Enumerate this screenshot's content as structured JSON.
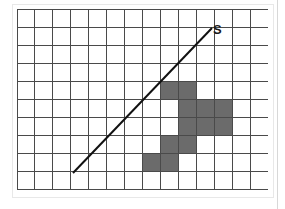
{
  "figure": {
    "label_s": "S",
    "background_color": "#ffffff",
    "frame_color": "#e8e8e8",
    "right_rule_color": "#d8d8d8"
  },
  "chart_data": {
    "type": "heatmap",
    "title": "",
    "subtitle": "",
    "xlabel": "",
    "ylabel": "",
    "grid": true,
    "legend_position": "none",
    "columns": 14,
    "rows": 10,
    "xlim": [
      0,
      14
    ],
    "ylim": [
      0,
      10
    ],
    "x_tick_labels": [],
    "y_tick_labels": [],
    "cell_width_px": 17.93,
    "cell_height_px": 18.1,
    "grid_line_color": "#4a4a4a",
    "shaded_cell_color": "#6b6b6b",
    "shaded_cell_border_color": "#4a4a4a",
    "shaded_cells": [
      {
        "col": 8,
        "row": 4
      },
      {
        "col": 9,
        "row": 4
      },
      {
        "col": 9,
        "row": 5
      },
      {
        "col": 10,
        "row": 5
      },
      {
        "col": 11,
        "row": 5
      },
      {
        "col": 9,
        "row": 6
      },
      {
        "col": 10,
        "row": 6
      },
      {
        "col": 11,
        "row": 6
      },
      {
        "col": 8,
        "row": 7
      },
      {
        "col": 9,
        "row": 7
      },
      {
        "col": 7,
        "row": 8
      },
      {
        "col": 8,
        "row": 8
      }
    ],
    "shaded_cell_count": 12,
    "annotations": [
      {
        "name": "line-s",
        "type": "line",
        "label": "S",
        "color": "#111111",
        "width_px": 2,
        "start_px": {
          "x": 56,
          "y": 164
        },
        "end_px": {
          "x": 195,
          "y": 19
        },
        "label_px": {
          "x": 196,
          "y": 14
        }
      }
    ]
  }
}
